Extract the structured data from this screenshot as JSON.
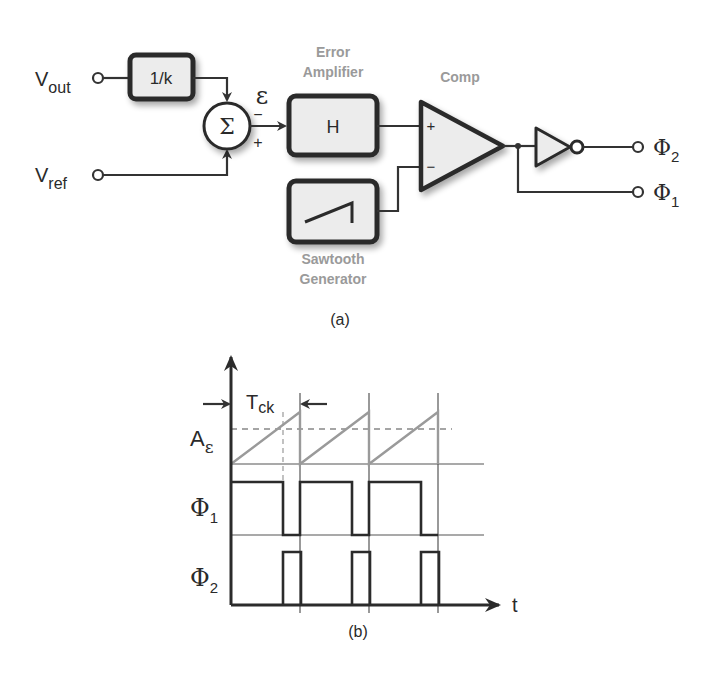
{
  "block_diagram": {
    "caption": "(a)",
    "inputs": {
      "vout": {
        "main": "V",
        "sub": "out"
      },
      "vref": {
        "main": "V",
        "sub": "ref"
      }
    },
    "feedback_block": {
      "label": "1/k"
    },
    "summer": {
      "symbol": "Σ",
      "minus": "−",
      "plus": "+"
    },
    "error_signal": "ε",
    "error_amplifier": {
      "title_line1": "Error",
      "title_line2": "Amplifier",
      "label": "H"
    },
    "sawtooth": {
      "title_line1": "Sawtooth",
      "title_line2": "Generator"
    },
    "comparator": {
      "title": "Comp",
      "plus": "+",
      "minus": "−"
    },
    "outputs": {
      "phi2": {
        "main": "Φ",
        "sub": "2"
      },
      "phi1": {
        "main": "Φ",
        "sub": "1"
      }
    }
  },
  "timing_diagram": {
    "caption": "(b)",
    "period_label": {
      "main": "T",
      "sub": "ck"
    },
    "threshold_label": {
      "main": "A",
      "sub": "ε"
    },
    "phi1_label": {
      "main": "Φ",
      "sub": "1"
    },
    "phi2_label": {
      "main": "Φ",
      "sub": "2"
    },
    "time_label": "t"
  },
  "colors": {
    "line": "#2b2b2b",
    "block_fill": "#ececec",
    "title_gray": "#9a9a9a",
    "ramp_gray": "#9a9a9a"
  }
}
